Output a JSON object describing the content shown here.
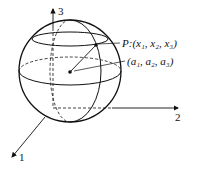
{
  "diagram": {
    "axes": {
      "x1": "1",
      "x2": "2",
      "x3": "3"
    },
    "point_label": "P:(x₁, x₂, x₃)",
    "center_label": "(a₁, a₂, a₃)"
  }
}
